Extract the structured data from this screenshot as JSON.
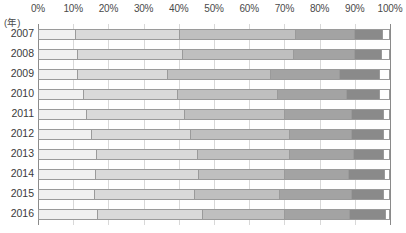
{
  "unit_label": "(年)",
  "axis": {
    "ticks": [
      "0%",
      "10%",
      "20%",
      "30%",
      "40%",
      "50%",
      "60%",
      "70%",
      "80%",
      "90%",
      "100%"
    ]
  },
  "colors": {
    "s1": "#f0f0f0",
    "s2": "#d9d9d9",
    "s3": "#bfbfbf",
    "s4": "#a3a3a3",
    "s5": "#8a8a8a",
    "s6": "#ffffff",
    "border": "#9a9a9a",
    "gridline": "#d8d8d8"
  },
  "chart_data": {
    "type": "bar",
    "orientation": "horizontal",
    "stacked": true,
    "normalized": true,
    "title": "",
    "xlabel": "",
    "ylabel": "(年)",
    "xlim": [
      0,
      100
    ],
    "grid": true,
    "legend": "none",
    "xticks": [
      "0%",
      "10%",
      "20%",
      "30%",
      "40%",
      "50%",
      "60%",
      "70%",
      "80%",
      "90%",
      "100%"
    ],
    "categories": [
      "2007",
      "2008",
      "2009",
      "2010",
      "2011",
      "2012",
      "2013",
      "2014",
      "2015",
      "2016"
    ],
    "series": [
      {
        "name": "s1",
        "values": [
          10.5,
          11.0,
          11.0,
          12.8,
          13.6,
          15.1,
          16.5,
          16.2,
          15.9,
          16.8
        ]
      },
      {
        "name": "s2",
        "values": [
          29.8,
          30.1,
          25.9,
          27.0,
          28.1,
          28.4,
          29.0,
          29.6,
          28.7,
          30.1
        ]
      },
      {
        "name": "s3",
        "values": [
          33.0,
          31.8,
          29.3,
          28.4,
          28.7,
          28.1,
          26.1,
          24.4,
          24.4,
          23.3
        ]
      },
      {
        "name": "s4",
        "values": [
          17.0,
          17.3,
          19.9,
          19.9,
          19.0,
          17.9,
          18.5,
          18.5,
          20.5,
          18.8
        ]
      },
      {
        "name": "s5",
        "values": [
          7.9,
          7.9,
          11.4,
          9.4,
          9.1,
          9.1,
          8.5,
          10.2,
          9.1,
          10.2
        ]
      },
      {
        "name": "s6",
        "values": [
          1.8,
          1.9,
          2.5,
          2.5,
          1.5,
          1.4,
          1.4,
          1.1,
          1.4,
          0.8
        ]
      }
    ]
  }
}
